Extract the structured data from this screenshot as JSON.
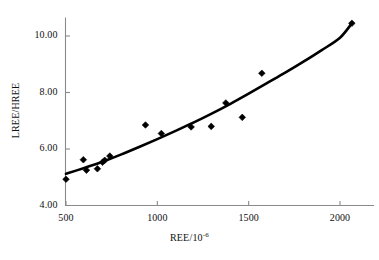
{
  "chart_data": {
    "type": "scatter",
    "title": "",
    "subtitle": "",
    "xlabel": "REE/10-6",
    "xlabel_base": "REE/10",
    "xlabel_exponent": "-6",
    "ylabel": "LREE/HREE",
    "xlim": [
      430,
      2150
    ],
    "ylim": [
      4.0,
      10.6
    ],
    "xticks": [
      500,
      1000,
      1500,
      2000
    ],
    "xtick_labels": [
      "500",
      "1000",
      "1500",
      "2000"
    ],
    "yticks": [
      4.0,
      6.0,
      8.0,
      10.0
    ],
    "ytick_labels": [
      "4.00",
      "6.00",
      "8.00",
      "10.00"
    ],
    "grid": false,
    "legend": null,
    "marker": "diamond",
    "marker_color": "#000000",
    "line_color": "#000000",
    "points": [
      {
        "x": 500,
        "y": 4.93
      },
      {
        "x": 595,
        "y": 5.62
      },
      {
        "x": 612,
        "y": 5.25
      },
      {
        "x": 672,
        "y": 5.3
      },
      {
        "x": 700,
        "y": 5.53
      },
      {
        "x": 712,
        "y": 5.6
      },
      {
        "x": 740,
        "y": 5.75
      },
      {
        "x": 935,
        "y": 6.85
      },
      {
        "x": 1022,
        "y": 6.55
      },
      {
        "x": 1185,
        "y": 6.78
      },
      {
        "x": 1295,
        "y": 6.8
      },
      {
        "x": 1375,
        "y": 7.63
      },
      {
        "x": 1465,
        "y": 7.12
      },
      {
        "x": 1572,
        "y": 8.68
      },
      {
        "x": 2065,
        "y": 10.45
      }
    ],
    "trend": {
      "type": "curve",
      "description": "smooth increasing fitted curve",
      "points": [
        {
          "x": 500,
          "y": 5.12
        },
        {
          "x": 600,
          "y": 5.33
        },
        {
          "x": 700,
          "y": 5.55
        },
        {
          "x": 800,
          "y": 5.8
        },
        {
          "x": 900,
          "y": 6.07
        },
        {
          "x": 1000,
          "y": 6.35
        },
        {
          "x": 1100,
          "y": 6.64
        },
        {
          "x": 1200,
          "y": 6.94
        },
        {
          "x": 1300,
          "y": 7.26
        },
        {
          "x": 1400,
          "y": 7.6
        },
        {
          "x": 1500,
          "y": 7.96
        },
        {
          "x": 1600,
          "y": 8.33
        },
        {
          "x": 1700,
          "y": 8.7
        },
        {
          "x": 1800,
          "y": 9.09
        },
        {
          "x": 1900,
          "y": 9.5
        },
        {
          "x": 2000,
          "y": 9.94
        },
        {
          "x": 2065,
          "y": 10.45
        }
      ]
    }
  },
  "axes": {
    "axis_color": "#8a8a8a",
    "tick_color": "#8a8a8a"
  }
}
